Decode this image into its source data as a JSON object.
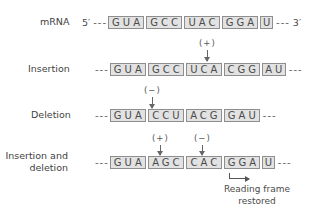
{
  "rows": {
    "mrna": {
      "label": "mRNA",
      "five_prime": "5′",
      "three_prime": "3′",
      "left_dash": "---",
      "right_dash": "---",
      "codons": [
        "GUA",
        "GCC",
        "UAC",
        "GGA",
        "U"
      ]
    },
    "insertion": {
      "label": "Insertion",
      "left_dash": "---",
      "right_dash": "---",
      "codons": [
        "GUA",
        "GCC",
        "UCA",
        "CGG",
        "AU"
      ],
      "marker": "(+)"
    },
    "deletion": {
      "label": "Deletion",
      "left_dash": "---",
      "right_dash": "---",
      "codons": [
        "GUA",
        "CCU",
        "ACG",
        "GAU"
      ],
      "marker": "(−)"
    },
    "insertion_deletion": {
      "label_line1": "Insertion and",
      "label_line2": "deletion",
      "left_dash": "---",
      "right_dash": "---",
      "codons": [
        "GUA",
        "AGC",
        "CAC",
        "GGA",
        "U"
      ],
      "marker_plus": "(+)",
      "marker_minus": "(−)"
    }
  },
  "annotation": {
    "line1": "Reading frame",
    "line2": "restored"
  },
  "colors": {
    "box_fill": "#e2e2e2",
    "box_border": "#8e8e8e",
    "text": "#4a4a4a"
  }
}
